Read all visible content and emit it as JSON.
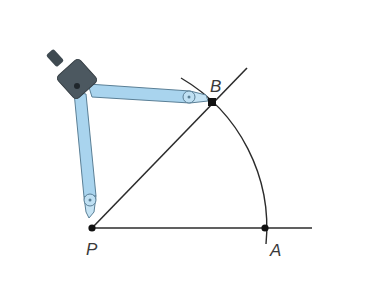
{
  "diagram": {
    "points": {
      "P": {
        "label": "P",
        "x": 92,
        "y": 228
      },
      "A": {
        "label": "A",
        "x": 265,
        "y": 228
      },
      "B": {
        "label": "B",
        "x": 212,
        "y": 102
      }
    },
    "colors": {
      "line": "#2b2b2b",
      "compass_leg": "#a9d4ee",
      "compass_leg_edge": "#5a7f96",
      "compass_head": "#4c5860"
    }
  }
}
